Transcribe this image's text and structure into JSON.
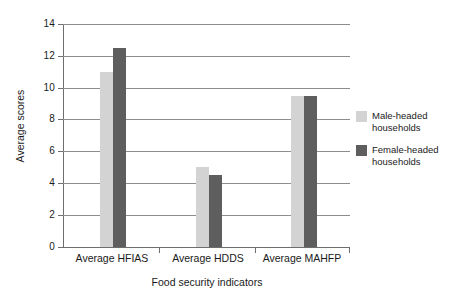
{
  "chart_data": {
    "type": "bar",
    "title": "",
    "categories": [
      "Average HFIAS",
      "Average HDDS",
      "Average MAHFP"
    ],
    "series": [
      {
        "name": "Male-headed households",
        "color": "#d3d3d3",
        "values": [
          11.0,
          5.0,
          9.5
        ]
      },
      {
        "name": "Female-headed households",
        "color": "#5e5e5e",
        "values": [
          12.5,
          4.5,
          9.5
        ]
      }
    ],
    "xlabel": "Food security indicators",
    "ylabel": "Average scores",
    "ylim": [
      0,
      14
    ],
    "ytick_step": 2,
    "yticks": [
      "14",
      "12",
      "10",
      "8",
      "6",
      "4",
      "2",
      "0"
    ],
    "grid": true,
    "legend_position": "right"
  },
  "legend": {
    "items": [
      {
        "label_line1": "Male-headed",
        "label_line2": "households",
        "swatch": "male-swatch"
      },
      {
        "label_line1": "Female-headed",
        "label_line2": "households",
        "swatch": "female-swatch"
      }
    ]
  },
  "axes": {
    "y_title": "Average scores",
    "x_title": "Food security indicators"
  }
}
